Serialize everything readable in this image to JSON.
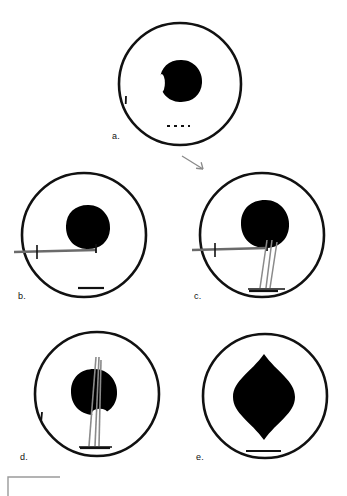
{
  "figure": {
    "type": "schematic-panel-series",
    "background_color": "#ffffff",
    "stroke_color": "#111111",
    "mass_color": "#000000",
    "instrument_color": "#6b6b6b",
    "panel_count": 5,
    "canvas": {
      "width": 347,
      "height": 496
    }
  },
  "panels": [
    {
      "id": "a",
      "label": "a.",
      "label_x": 112,
      "label_y": 131,
      "circle": {
        "cx": 180,
        "cy": 84,
        "r": 61,
        "stroke_width": 2.6
      },
      "mass": {
        "shape": "round-irregular",
        "cx": 181,
        "cy": 81,
        "rx": 21,
        "ry": 21,
        "notch": true,
        "notch_side": "left"
      },
      "tick_marks": [
        {
          "name": "left-wall-tick",
          "x": 126,
          "y": 96,
          "length": 8,
          "angle": 92
        }
      ],
      "scale_bar": {
        "x1": 167,
        "x2": 190,
        "y": 126,
        "style": "dashed",
        "stroke_width": 2.2,
        "dash_segments": 2
      },
      "instruments": [],
      "annotation_arrow": {
        "present": true,
        "x1": 182,
        "y1": 156,
        "x2": 203,
        "y2": 169,
        "color": "#8a8a8a",
        "head": "barbed"
      }
    },
    {
      "id": "b",
      "label": "b.",
      "label_x": 18,
      "label_y": 291,
      "circle": {
        "cx": 84,
        "cy": 235,
        "r": 62,
        "stroke_width": 2.6
      },
      "mass": {
        "shape": "round",
        "cx": 88,
        "cy": 227,
        "rx": 22,
        "ry": 22,
        "notch": false,
        "notch_side": "none"
      },
      "tick_marks": [],
      "scale_bar": {
        "x1": 78,
        "x2": 104,
        "y": 288,
        "style": "solid",
        "stroke_width": 2.2,
        "dash_segments": 1
      },
      "instruments": [
        {
          "name": "horizontal-needle",
          "type": "needle-horizontal",
          "x1": 14,
          "y1": 252,
          "x2": 96,
          "y2": 250,
          "stroke_width": 2.4,
          "color": "#6b6b6b",
          "crosshatch_x": 37,
          "tip_bracket": true
        }
      ],
      "annotation_arrow": {
        "present": false
      }
    },
    {
      "id": "c",
      "label": "c.",
      "label_x": 194,
      "label_y": 291,
      "circle": {
        "cx": 262,
        "cy": 235,
        "r": 62,
        "stroke_width": 2.6
      },
      "mass": {
        "shape": "round",
        "cx": 265,
        "cy": 224,
        "rx": 24,
        "ry": 24,
        "notch": false,
        "notch_side": "none"
      },
      "tick_marks": [],
      "scale_bar": {
        "x1": 249,
        "x2": 278,
        "y": 291,
        "style": "solid",
        "stroke_width": 2.2,
        "dash_segments": 1
      },
      "instruments": [
        {
          "name": "horizontal-needle",
          "type": "needle-horizontal",
          "x1": 192,
          "y1": 250,
          "x2": 267,
          "y2": 248,
          "stroke_width": 2.4,
          "color": "#6b6b6b",
          "crosshatch_x": 215,
          "tip_bracket": true
        },
        {
          "name": "vertical-probe-left",
          "type": "probe-vertical",
          "x1": 267,
          "y1": 240,
          "x2": 260,
          "y2": 288,
          "stroke_width": 1.5,
          "color": "#8a8a8a"
        },
        {
          "name": "vertical-probe-right",
          "type": "probe-vertical",
          "x1": 272,
          "y1": 240,
          "x2": 266,
          "y2": 288,
          "stroke_width": 1.5,
          "color": "#8a8a8a"
        },
        {
          "name": "vertical-probe-outer",
          "type": "probe-vertical",
          "x1": 277,
          "y1": 242,
          "x2": 270,
          "y2": 288,
          "stroke_width": 1.5,
          "color": "#8a8a8a"
        },
        {
          "name": "probe-base-plate",
          "type": "base-plate",
          "x1": 248,
          "y1": 289,
          "x2": 285,
          "y2": 289,
          "stroke_width": 2.2,
          "color": "#4a4a4a"
        }
      ],
      "annotation_arrow": {
        "present": false
      }
    },
    {
      "id": "d",
      "label": "d.",
      "label_x": 20,
      "label_y": 452,
      "circle": {
        "cx": 97,
        "cy": 394,
        "r": 62,
        "stroke_width": 2.6
      },
      "mass": {
        "shape": "round-notched",
        "cx": 94,
        "cy": 392,
        "rx": 23,
        "ry": 23,
        "notch": true,
        "notch_side": "bottom-right"
      },
      "tick_marks": [
        {
          "name": "left-wall-tick",
          "x": 42,
          "y": 412,
          "length": 8,
          "angle": 95
        }
      ],
      "scale_bar": {
        "x1": 80,
        "x2": 110,
        "y": 448,
        "style": "solid",
        "stroke_width": 2.2,
        "dash_segments": 1
      },
      "instruments": [
        {
          "name": "vertical-probe-left",
          "type": "probe-vertical",
          "x1": 96,
          "y1": 357,
          "x2": 89,
          "y2": 446,
          "stroke_width": 1.6,
          "color": "#8a8a8a"
        },
        {
          "name": "vertical-probe-right",
          "type": "probe-vertical",
          "x1": 99,
          "y1": 357,
          "x2": 95,
          "y2": 446,
          "stroke_width": 1.6,
          "color": "#8a8a8a"
        },
        {
          "name": "vertical-probe-outer",
          "type": "probe-vertical",
          "x1": 101,
          "y1": 360,
          "x2": 99,
          "y2": 446,
          "stroke_width": 1.6,
          "color": "#8a8a8a"
        },
        {
          "name": "probe-base-plate",
          "type": "base-plate",
          "x1": 79,
          "y1": 447,
          "x2": 112,
          "y2": 447,
          "stroke_width": 2.2,
          "color": "#4a4a4a"
        }
      ],
      "annotation_arrow": {
        "present": false
      }
    },
    {
      "id": "e",
      "label": "e.",
      "label_x": 196,
      "label_y": 452,
      "circle": {
        "cx": 265,
        "cy": 396,
        "r": 62,
        "stroke_width": 2.6
      },
      "mass": {
        "shape": "cusped-oval",
        "cx": 264,
        "cy": 397,
        "rx": 31,
        "ry": 31,
        "notch": false,
        "notch_side": "none",
        "cusp_top": true,
        "cusp_bottom": true,
        "cusp_height": 12
      },
      "tick_marks": [],
      "scale_bar": {
        "x1": 246,
        "x2": 281,
        "y": 451,
        "style": "solid",
        "stroke_width": 2.2,
        "dash_segments": 1
      },
      "instruments": [],
      "annotation_arrow": {
        "present": false
      }
    }
  ],
  "global_scale_bar": {
    "name": "global-scale-bar",
    "shape": "L-shaped",
    "corner_x": 8,
    "corner_y": 477,
    "horizontal_end_x": 60,
    "vertical_end_y": 496,
    "color": "#9a9a9a",
    "stroke_width": 1.4
  }
}
